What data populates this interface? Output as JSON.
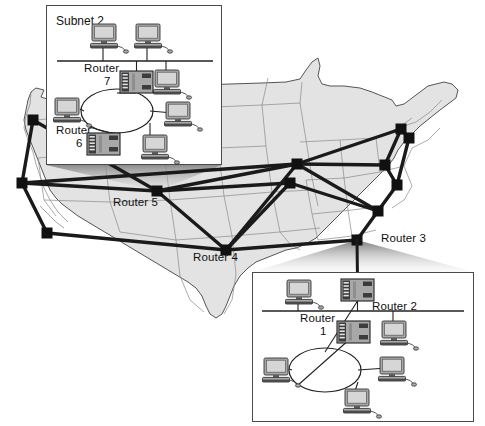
{
  "figure": {
    "kind": "network-topology-map",
    "region": "United States"
  },
  "colors": {
    "map_fill": "#e3e3e3",
    "map_stroke": "#8a8a8a",
    "map_outline": "#555555",
    "link": "#1a1a1a",
    "node": "#111111",
    "inset_border": "#4a4a4a",
    "inset_fill": "#ffffff",
    "device_body": "#a8a8a8",
    "device_dark": "#3c3c3c",
    "screen": "#d6d6d6",
    "text": "#111111",
    "cone": "#9a9a9a"
  },
  "map_labels": [
    {
      "id": "router-5",
      "text": "Router 5",
      "x": 113,
      "y": 196
    },
    {
      "id": "router-4",
      "text": "Router 4",
      "x": 193,
      "y": 251
    },
    {
      "id": "router-3",
      "text": "Router 3",
      "x": 381,
      "y": 232
    }
  ],
  "backbone": {
    "nodes": [
      {
        "id": "n-seattle",
        "x": 33,
        "y": 120
      },
      {
        "id": "n-sanfran",
        "x": 22,
        "y": 183
      },
      {
        "id": "n-losangeles",
        "x": 47,
        "y": 233
      },
      {
        "id": "n-router5",
        "x": 157,
        "y": 191
      },
      {
        "id": "n-router4",
        "x": 226,
        "y": 250
      },
      {
        "id": "n-chicago",
        "x": 297,
        "y": 164
      },
      {
        "id": "n-stlouis",
        "x": 290,
        "y": 183
      },
      {
        "id": "n-atlanta",
        "x": 378,
        "y": 211
      },
      {
        "id": "n-router3",
        "x": 357,
        "y": 240
      },
      {
        "id": "n-cleveland",
        "x": 385,
        "y": 165
      },
      {
        "id": "n-dc",
        "x": 397,
        "y": 185
      },
      {
        "id": "n-newyork",
        "x": 401,
        "y": 129
      },
      {
        "id": "n-boston",
        "x": 409,
        "y": 138
      }
    ],
    "links": [
      [
        "n-seattle",
        "n-sanfran"
      ],
      [
        "n-sanfran",
        "n-losangeles"
      ],
      [
        "n-seattle",
        "n-router5"
      ],
      [
        "n-sanfran",
        "n-router5"
      ],
      [
        "n-sanfran",
        "n-chicago"
      ],
      [
        "n-losangeles",
        "n-router4"
      ],
      [
        "n-router5",
        "n-router4"
      ],
      [
        "n-router5",
        "n-chicago"
      ],
      [
        "n-router5",
        "n-stlouis"
      ],
      [
        "n-router4",
        "n-chicago"
      ],
      [
        "n-router4",
        "n-stlouis"
      ],
      [
        "n-router4",
        "n-router3"
      ],
      [
        "n-chicago",
        "n-cleveland"
      ],
      [
        "n-chicago",
        "n-newyork"
      ],
      [
        "n-chicago",
        "n-atlanta"
      ],
      [
        "n-stlouis",
        "n-atlanta"
      ],
      [
        "n-cleveland",
        "n-newyork"
      ],
      [
        "n-cleveland",
        "n-dc"
      ],
      [
        "n-newyork",
        "n-boston"
      ],
      [
        "n-boston",
        "n-dc"
      ],
      [
        "n-dc",
        "n-atlanta"
      ],
      [
        "n-atlanta",
        "n-router3"
      ]
    ]
  },
  "insets": [
    {
      "id": "subnet-2",
      "title": "Subnet 2",
      "title_pos": {
        "x": 56,
        "y": 14
      },
      "box": {
        "x": 46,
        "y": 5,
        "width": 176,
        "height": 160
      },
      "bus": {
        "x1": 57,
        "y1": 61,
        "x2": 213,
        "y2": 61
      },
      "cloud_label": "",
      "cloud": {
        "cx": 117,
        "cy": 111,
        "rx": 36,
        "ry": 22
      },
      "routers": [
        {
          "id": "router-7",
          "label": "Router",
          "label2": "7",
          "label_x": 84,
          "label_y": 62,
          "label2_x": 104,
          "label2_y": 75,
          "x": 120,
          "y": 71,
          "w": 33,
          "h": 22
        },
        {
          "id": "router-6",
          "label": "Router",
          "label2": "6",
          "label_x": 56,
          "label_y": 124,
          "label2_x": 76,
          "label2_y": 137,
          "x": 87,
          "y": 133,
          "w": 33,
          "h": 22
        }
      ],
      "hosts": [
        {
          "id": "pc-2a",
          "x": 92,
          "y": 24,
          "link": "bus-down"
        },
        {
          "id": "pc-2b",
          "x": 136,
          "y": 24,
          "link": "bus-down"
        },
        {
          "id": "pc-2c",
          "x": 155,
          "y": 70,
          "link": "bus-up"
        },
        {
          "id": "pc-2d",
          "x": 55,
          "y": 98,
          "link": "cloud"
        },
        {
          "id": "pc-2e",
          "x": 166,
          "y": 102,
          "link": "cloud"
        },
        {
          "id": "pc-2f",
          "x": 143,
          "y": 135,
          "link": "cloud"
        }
      ]
    },
    {
      "id": "subnet-1",
      "title": "",
      "box": {
        "x": 252,
        "y": 272,
        "width": 222,
        "height": 150
      },
      "bus": {
        "x1": 262,
        "y1": 311,
        "x2": 464,
        "y2": 311
      },
      "cloud_label": "Subnet 1",
      "cloud": {
        "cx": 325,
        "cy": 370,
        "rx": 36,
        "ry": 22
      },
      "routers": [
        {
          "id": "router-2",
          "label": "Router 2",
          "label2": "",
          "label_x": 372,
          "label_y": 300,
          "label2_x": 0,
          "label2_y": 0,
          "x": 341,
          "y": 279,
          "w": 33,
          "h": 22
        },
        {
          "id": "router-1",
          "label": "Router",
          "label2": "1",
          "label_x": 300,
          "label_y": 312,
          "label2_x": 320,
          "label2_y": 325,
          "x": 337,
          "y": 321,
          "w": 33,
          "h": 22
        }
      ],
      "hosts": [
        {
          "id": "pc-1a",
          "x": 287,
          "y": 280,
          "link": "bus-down"
        },
        {
          "id": "pc-1b",
          "x": 382,
          "y": 321,
          "link": "bus-down"
        },
        {
          "id": "pc-1c",
          "x": 264,
          "y": 358,
          "link": "cloud"
        },
        {
          "id": "pc-1d",
          "x": 380,
          "y": 357,
          "link": "cloud"
        },
        {
          "id": "pc-1e",
          "x": 345,
          "y": 389,
          "link": "cloud"
        }
      ]
    }
  ],
  "callout_cones": [
    {
      "id": "cone-subnet-2",
      "from_node": "n-router5",
      "to_box": "subnet-2"
    },
    {
      "id": "cone-subnet-1",
      "from_node": "n-router3",
      "to_box": "subnet-1"
    }
  ],
  "inset_uplinks": [
    {
      "id": "uplink-router2",
      "from": "n-router3",
      "to": "router-2"
    }
  ]
}
